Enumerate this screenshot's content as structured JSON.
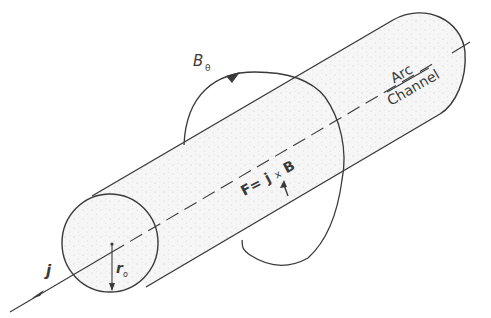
{
  "diagram": {
    "labels": {
      "b_field": "B",
      "b_field_sub": "θ",
      "arc_top": "Arc",
      "arc_bottom": "Channel",
      "force_f": "F=",
      "force_j": "j",
      "force_x": "x",
      "force_b": "B",
      "current": "j",
      "radius": "r",
      "radius_sub": "o"
    },
    "colors": {
      "line": "#3a3a3a",
      "fill": "#f4f4f4",
      "stipple": "#c8c8c8"
    }
  }
}
